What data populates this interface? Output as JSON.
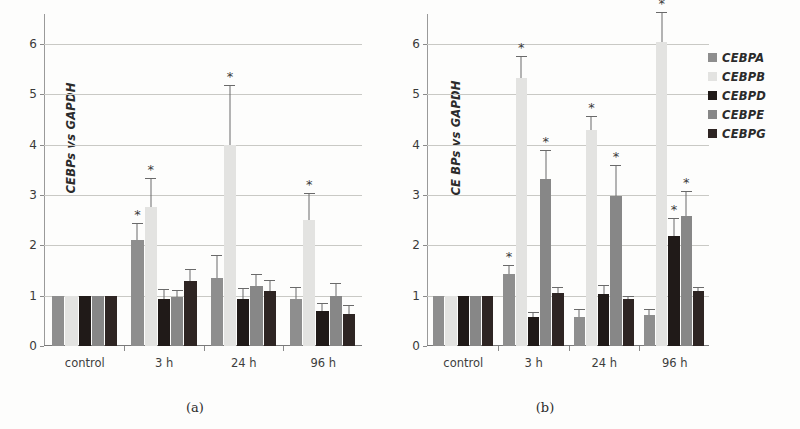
{
  "figure": {
    "panels": [
      {
        "id": "a",
        "caption": "(a)",
        "ylabel": "CEBPs vs GAPDH"
      },
      {
        "id": "b",
        "caption": "(b)",
        "ylabel": "CE BPs vs GAPDH"
      }
    ]
  },
  "legend": {
    "position": "right",
    "items": [
      {
        "label": "CEBPA",
        "color": "#8e8e8e"
      },
      {
        "label": "CEBPB",
        "color": "#e3e3e1"
      },
      {
        "label": "CEBPD",
        "color": "#201a18"
      },
      {
        "label": "CEBPE",
        "color": "#878787"
      },
      {
        "label": "CEBPG",
        "color": "#2e2523"
      }
    ]
  },
  "axis": {
    "yticks": [
      "0",
      "1",
      "2",
      "3",
      "4",
      "5",
      "6"
    ],
    "ymin": 0,
    "ymax": 6.6,
    "categories": [
      "control",
      "3 h",
      "24 h",
      "96 h"
    ]
  },
  "chart_data": [
    {
      "type": "bar",
      "title": "(a)",
      "xlabel": "",
      "ylabel": "CEBPs vs GAPDH",
      "ylim": [
        0,
        6.6
      ],
      "grid": true,
      "categories": [
        "control",
        "3 h",
        "24 h",
        "96 h"
      ],
      "series": [
        {
          "name": "CEBPA",
          "color": "#8e8e8e",
          "values": [
            1.0,
            2.11,
            1.36,
            0.94
          ],
          "errors": [
            0.0,
            0.33,
            0.45,
            0.24
          ],
          "significant": [
            false,
            true,
            false,
            false
          ]
        },
        {
          "name": "CEBPB",
          "color": "#e3e3e1",
          "values": [
            1.0,
            2.77,
            3.99,
            2.5
          ],
          "errors": [
            0.0,
            0.58,
            1.19,
            0.55
          ],
          "significant": [
            false,
            true,
            true,
            true
          ]
        },
        {
          "name": "CEBPD",
          "color": "#201a18",
          "values": [
            1.0,
            0.93,
            0.94,
            0.7
          ],
          "errors": [
            0.0,
            0.21,
            0.21,
            0.16
          ],
          "significant": [
            false,
            false,
            false,
            false
          ]
        },
        {
          "name": "CEBPE",
          "color": "#878787",
          "values": [
            1.0,
            0.98,
            1.2,
            1.0
          ],
          "errors": [
            0.0,
            0.13,
            0.23,
            0.25
          ],
          "significant": [
            false,
            false,
            false,
            false
          ]
        },
        {
          "name": "CEBPG",
          "color": "#2e2523",
          "values": [
            1.0,
            1.29,
            1.09,
            0.64
          ],
          "errors": [
            0.0,
            0.25,
            0.22,
            0.17
          ],
          "significant": [
            false,
            false,
            false,
            false
          ]
        }
      ]
    },
    {
      "type": "bar",
      "title": "(b)",
      "xlabel": "",
      "ylabel": "CE BPs vs GAPDH",
      "ylim": [
        0,
        6.6
      ],
      "grid": true,
      "categories": [
        "control",
        "3 h",
        "24 h",
        "96 h"
      ],
      "series": [
        {
          "name": "CEBPA",
          "color": "#8e8e8e",
          "values": [
            1.0,
            1.43,
            0.58,
            0.62
          ],
          "errors": [
            0.0,
            0.18,
            0.15,
            0.11
          ],
          "significant": [
            false,
            true,
            false,
            false
          ]
        },
        {
          "name": "CEBPB",
          "color": "#e3e3e1",
          "values": [
            1.0,
            5.33,
            4.3,
            6.05
          ],
          "errors": [
            0.0,
            0.43,
            0.27,
            0.6
          ],
          "significant": [
            false,
            true,
            true,
            true
          ]
        },
        {
          "name": "CEBPD",
          "color": "#201a18",
          "values": [
            1.0,
            0.57,
            1.03,
            2.18
          ],
          "errors": [
            0.0,
            0.1,
            0.18,
            0.36
          ],
          "significant": [
            false,
            false,
            false,
            true
          ]
        },
        {
          "name": "CEBPE",
          "color": "#878787",
          "values": [
            1.0,
            3.33,
            2.99,
            2.58
          ],
          "errors": [
            0.0,
            0.56,
            0.61,
            0.5
          ],
          "significant": [
            false,
            true,
            true,
            true
          ]
        },
        {
          "name": "CEBPG",
          "color": "#2e2523",
          "values": [
            1.0,
            1.05,
            0.93,
            1.09
          ],
          "errors": [
            0.0,
            0.12,
            0.07,
            0.09
          ],
          "significant": [
            false,
            false,
            false,
            false
          ]
        }
      ]
    }
  ]
}
